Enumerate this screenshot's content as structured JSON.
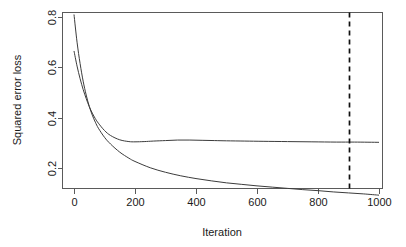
{
  "chart_data": {
    "type": "line",
    "title": "",
    "xlabel": "Iteration",
    "ylabel": "Squared error loss",
    "xlim": [
      0,
      1000
    ],
    "ylim": [
      0.05,
      0.83
    ],
    "grid": false,
    "legend": "none",
    "xticks": [
      0,
      200,
      400,
      600,
      800,
      1000
    ],
    "xtick_labels": [
      "0",
      "200",
      "400",
      "600",
      "800",
      "1000"
    ],
    "yticks": [
      0.2,
      0.4,
      0.6,
      0.8
    ],
    "ytick_labels": [
      "0.2",
      "0.4",
      "0.6",
      "0.8"
    ],
    "annotations": [
      {
        "name": "early-stopping-line",
        "type": "vline",
        "x": 900,
        "style": "dashed",
        "color": "#101010"
      }
    ],
    "series": [
      {
        "name": "training-loss",
        "color": "#3c3c3c",
        "x": [
          0,
          10,
          20,
          30,
          40,
          50,
          60,
          70,
          80,
          100,
          120,
          150,
          180,
          200,
          250,
          300,
          350,
          400,
          450,
          500,
          550,
          600,
          650,
          700,
          750,
          800,
          850,
          900,
          950,
          1000
        ],
        "y": [
          0.81,
          0.7,
          0.615,
          0.545,
          0.49,
          0.445,
          0.41,
          0.382,
          0.358,
          0.322,
          0.295,
          0.263,
          0.239,
          0.226,
          0.201,
          0.183,
          0.169,
          0.158,
          0.149,
          0.141,
          0.135,
          0.129,
          0.124,
          0.119,
          0.114,
          0.11,
          0.105,
          0.101,
          0.097,
          0.092
        ]
      },
      {
        "name": "validation-loss",
        "color": "#3c3c3c",
        "x": [
          0,
          10,
          20,
          30,
          40,
          50,
          60,
          70,
          80,
          100,
          120,
          150,
          180,
          200,
          230,
          260,
          300,
          340,
          380,
          420,
          460,
          500,
          560,
          620,
          700,
          780,
          860,
          920,
          1000
        ],
        "y": [
          0.665,
          0.605,
          0.555,
          0.512,
          0.476,
          0.444,
          0.418,
          0.396,
          0.378,
          0.349,
          0.329,
          0.312,
          0.305,
          0.304,
          0.305,
          0.307,
          0.309,
          0.311,
          0.311,
          0.31,
          0.309,
          0.308,
          0.307,
          0.306,
          0.305,
          0.304,
          0.303,
          0.303,
          0.302
        ]
      }
    ]
  },
  "axes": {
    "y_title": "Squared error loss",
    "x_title": "Iteration"
  }
}
